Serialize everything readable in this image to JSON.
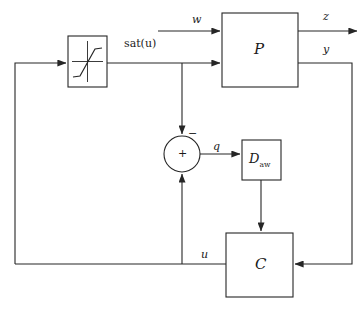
{
  "diagram": {
    "type": "control-block-diagram",
    "background_color": "#ffffff",
    "line_color": "#262626",
    "text_color": "#1a1a1a"
  },
  "blocks": {
    "saturation": {
      "name": "saturation-nonlinearity",
      "label": "",
      "icon": "saturation-curve-icon",
      "x": 68,
      "y": 36,
      "w": 39,
      "h": 51
    },
    "plant": {
      "name": "plant-block",
      "label": "P",
      "x": 222,
      "y": 13,
      "w": 76,
      "h": 74
    },
    "antiwindup": {
      "name": "anti-windup-compensator-block",
      "label": "D",
      "sublabel": "aw",
      "x": 242,
      "y": 140,
      "w": 39,
      "h": 40
    },
    "controller": {
      "name": "controller-block",
      "label": "C",
      "x": 226,
      "y": 233,
      "w": 67,
      "h": 64
    }
  },
  "summing_junction": {
    "name": "summing-junction",
    "cx": 182,
    "cy": 154,
    "r": 18,
    "inner_sign": "+",
    "top_input_sign": "−",
    "bottom_input_sign": "+"
  },
  "signals": {
    "w": {
      "label": "w",
      "x": 192,
      "y": 14
    },
    "z": {
      "label": "z",
      "x": 323,
      "y": 11
    },
    "y": {
      "label": "y",
      "x": 323,
      "y": 44
    },
    "sat_u": {
      "label": "sat(u)",
      "x": 124,
      "y": 38
    },
    "q": {
      "label": "q",
      "x": 213,
      "y": 141
    },
    "u": {
      "label": "u",
      "x": 201,
      "y": 249
    }
  },
  "edges": [
    {
      "name": "edge-w-to-plant",
      "from": "w-source",
      "to": "plant",
      "arrow": true
    },
    {
      "name": "edge-plant-to-z",
      "from": "plant",
      "to": "z-sink",
      "arrow": true
    },
    {
      "name": "edge-plant-y-to-controller",
      "from": "plant",
      "to": "controller",
      "arrow": true
    },
    {
      "name": "edge-saturation-to-plant",
      "from": "saturation",
      "to": "plant",
      "arrow": true
    },
    {
      "name": "edge-saturation-to-summer",
      "from": "saturation",
      "to": "summing-junction",
      "arrow": true
    },
    {
      "name": "edge-u-to-summer",
      "from": "controller",
      "to": "summing-junction",
      "arrow": true
    },
    {
      "name": "edge-summer-to-antiwindup",
      "from": "summing-junction",
      "to": "antiwindup",
      "arrow": true
    },
    {
      "name": "edge-antiwindup-to-controller",
      "from": "antiwindup",
      "to": "controller",
      "arrow": true
    },
    {
      "name": "edge-u-to-saturation",
      "from": "controller",
      "to": "saturation",
      "arrow": true
    }
  ]
}
